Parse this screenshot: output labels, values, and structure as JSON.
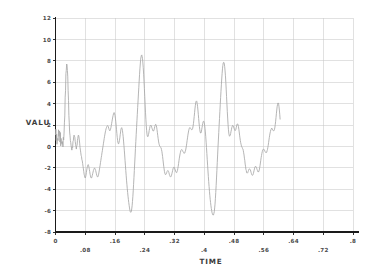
{
  "chart_data": {
    "type": "line",
    "title": "",
    "xlabel": "TIME",
    "ylabel": "VALU",
    "xlim": [
      0,
      0.8
    ],
    "ylim": [
      -8,
      12
    ],
    "grid": true,
    "legend": false,
    "line_color": "#a8a8a8",
    "axis_color": "#1a1a1a",
    "grid_color": "#c8c8c8",
    "x_ticks": [
      0,
      0.08,
      0.16,
      0.24,
      0.32,
      0.4,
      0.48,
      0.56,
      0.64,
      0.72,
      0.8
    ],
    "x_tick_labels": [
      "0",
      ".08",
      ".16",
      ".24",
      ".32",
      ".4",
      ".48",
      ".56",
      ".64",
      ".72",
      ".8"
    ],
    "y_ticks": [
      -8,
      -6,
      -4,
      -2,
      0,
      2,
      4,
      6,
      8,
      10,
      12
    ],
    "y_tick_labels": [
      "-8",
      "-6",
      "-4",
      "-2",
      "0",
      "2",
      "4",
      "6",
      "8",
      "10",
      "12"
    ],
    "x": [
      0.0,
      0.002,
      0.004,
      0.006,
      0.008,
      0.01,
      0.012,
      0.014,
      0.016,
      0.018,
      0.02,
      0.022,
      0.024,
      0.026,
      0.028,
      0.03,
      0.032,
      0.034,
      0.036,
      0.038,
      0.04,
      0.042,
      0.044,
      0.046,
      0.048,
      0.05,
      0.052,
      0.054,
      0.056,
      0.058,
      0.06,
      0.062,
      0.064,
      0.066,
      0.068,
      0.07,
      0.072,
      0.074,
      0.076,
      0.078,
      0.08,
      0.082,
      0.084,
      0.086,
      0.088,
      0.09,
      0.092,
      0.094,
      0.096,
      0.098,
      0.1,
      0.102,
      0.104,
      0.106,
      0.108,
      0.11,
      0.112,
      0.114,
      0.116,
      0.118,
      0.12,
      0.122,
      0.124,
      0.126,
      0.128,
      0.13,
      0.132,
      0.134,
      0.136,
      0.138,
      0.14,
      0.142,
      0.144,
      0.146,
      0.148,
      0.15,
      0.152,
      0.154,
      0.156,
      0.158,
      0.16,
      0.162,
      0.164,
      0.166,
      0.168,
      0.17,
      0.172,
      0.174,
      0.176,
      0.178,
      0.18,
      0.182,
      0.184,
      0.186,
      0.188,
      0.19,
      0.192,
      0.194,
      0.196,
      0.198,
      0.2,
      0.202,
      0.204,
      0.206,
      0.208,
      0.21,
      0.212,
      0.214,
      0.216,
      0.218,
      0.22,
      0.222,
      0.224,
      0.226,
      0.228,
      0.23,
      0.232,
      0.234,
      0.236,
      0.238,
      0.24,
      0.242,
      0.244,
      0.246,
      0.248,
      0.25,
      0.252,
      0.254,
      0.256,
      0.258,
      0.26,
      0.262,
      0.264,
      0.266,
      0.268,
      0.27,
      0.272,
      0.274,
      0.276,
      0.278,
      0.28,
      0.282,
      0.284,
      0.286,
      0.288,
      0.29,
      0.292,
      0.294,
      0.296,
      0.298,
      0.3,
      0.302,
      0.304,
      0.306,
      0.308,
      0.31,
      0.312,
      0.314,
      0.316,
      0.318,
      0.32,
      0.322,
      0.324,
      0.326,
      0.328,
      0.33,
      0.332,
      0.334,
      0.336,
      0.338,
      0.34,
      0.342,
      0.344,
      0.346,
      0.348,
      0.35,
      0.352,
      0.354,
      0.356,
      0.358,
      0.36,
      0.362,
      0.364,
      0.366,
      0.368,
      0.37,
      0.372,
      0.374,
      0.376,
      0.378,
      0.38,
      0.382,
      0.384,
      0.386,
      0.388,
      0.39,
      0.392,
      0.394,
      0.396,
      0.398,
      0.4,
      0.402,
      0.404,
      0.406,
      0.408,
      0.41,
      0.412,
      0.414,
      0.416,
      0.418,
      0.42,
      0.422,
      0.424,
      0.426,
      0.428,
      0.43,
      0.432,
      0.434,
      0.436,
      0.438,
      0.44,
      0.442,
      0.444,
      0.446,
      0.448,
      0.45,
      0.452,
      0.454,
      0.456,
      0.458,
      0.46,
      0.462,
      0.464,
      0.466,
      0.468,
      0.47,
      0.472,
      0.474,
      0.476,
      0.478,
      0.48,
      0.482,
      0.484,
      0.486,
      0.488,
      0.49,
      0.492,
      0.494,
      0.496,
      0.498,
      0.5,
      0.502,
      0.504,
      0.506,
      0.508,
      0.51,
      0.512,
      0.514,
      0.516,
      0.518,
      0.52,
      0.522,
      0.524,
      0.526,
      0.528,
      0.53,
      0.532,
      0.534,
      0.536,
      0.538,
      0.54,
      0.542,
      0.544,
      0.546,
      0.548,
      0.55,
      0.552,
      0.554,
      0.556,
      0.558,
      0.56,
      0.562,
      0.564,
      0.566,
      0.568,
      0.57,
      0.572,
      0.574,
      0.576,
      0.578,
      0.58,
      0.582,
      0.584,
      0.586,
      0.588,
      0.59,
      0.592,
      0.594,
      0.596,
      0.598,
      0.6,
      0.602,
      0.604
    ],
    "y": [
      1.1,
      0.55,
      0.2,
      0.75,
      1.55,
      1.2,
      0.4,
      0.05,
      0.3,
      0.2,
      -0.05,
      0.6,
      2.2,
      4.6,
      6.8,
      7.7,
      7.1,
      5.2,
      2.9,
      1.35,
      0.55,
      0.05,
      -0.35,
      -0.1,
      0.55,
      1.05,
      0.85,
      0.2,
      -0.25,
      0.1,
      0.75,
      1.05,
      0.6,
      -0.1,
      -0.6,
      -0.95,
      -1.35,
      -1.85,
      -2.35,
      -2.75,
      -2.95,
      -2.7,
      -2.2,
      -1.85,
      -1.7,
      -1.95,
      -2.35,
      -2.75,
      -2.95,
      -2.85,
      -2.55,
      -2.25,
      -2.05,
      -2.05,
      -2.25,
      -2.55,
      -2.8,
      -2.85,
      -2.6,
      -2.2,
      -1.75,
      -1.3,
      -0.85,
      -0.4,
      0.05,
      0.5,
      0.95,
      1.35,
      1.65,
      1.85,
      1.95,
      1.85,
      1.6,
      1.45,
      1.6,
      1.95,
      2.35,
      2.75,
      3.05,
      3.15,
      2.9,
      2.35,
      1.6,
      0.85,
      0.35,
      0.25,
      0.55,
      1.1,
      1.6,
      1.75,
      1.5,
      0.9,
      0.1,
      -0.8,
      -1.75,
      -2.7,
      -3.55,
      -4.3,
      -4.95,
      -5.5,
      -5.95,
      -6.15,
      -6.05,
      -5.55,
      -4.7,
      -3.55,
      -2.25,
      -0.9,
      0.45,
      1.75,
      3.0,
      4.25,
      5.5,
      6.7,
      7.7,
      8.35,
      8.55,
      8.2,
      7.35,
      6.1,
      4.65,
      3.2,
      1.95,
      1.15,
      0.9,
      1.1,
      1.5,
      1.85,
      2.0,
      1.9,
      1.65,
      1.45,
      1.45,
      1.7,
      2.0,
      2.05,
      1.8,
      1.3,
      0.75,
      0.3,
      0.05,
      -0.05,
      -0.15,
      -0.45,
      -0.95,
      -1.55,
      -2.1,
      -2.5,
      -2.65,
      -2.55,
      -2.35,
      -2.25,
      -2.35,
      -2.6,
      -2.8,
      -2.85,
      -2.7,
      -2.4,
      -2.1,
      -1.95,
      -2.0,
      -2.2,
      -2.4,
      -2.45,
      -2.25,
      -1.85,
      -1.35,
      -0.9,
      -0.55,
      -0.35,
      -0.3,
      -0.4,
      -0.55,
      -0.65,
      -0.6,
      -0.35,
      0.05,
      0.55,
      1.05,
      1.45,
      1.7,
      1.75,
      1.65,
      1.55,
      1.6,
      1.9,
      2.45,
      3.15,
      3.8,
      4.2,
      4.2,
      3.75,
      3.0,
      2.2,
      1.55,
      1.25,
      1.35,
      1.75,
      2.15,
      2.35,
      2.2,
      1.7,
      0.9,
      -0.1,
      -1.2,
      -2.3,
      -3.3,
      -4.2,
      -4.95,
      -5.55,
      -6.0,
      -6.3,
      -6.4,
      -6.25,
      -5.75,
      -4.85,
      -3.65,
      -2.25,
      -0.8,
      0.6,
      1.95,
      3.25,
      4.55,
      5.75,
      6.8,
      7.55,
      7.85,
      7.7,
      7.05,
      6.0,
      4.65,
      3.25,
      2.05,
      1.25,
      0.95,
      1.05,
      1.4,
      1.75,
      1.95,
      1.9,
      1.7,
      1.5,
      1.5,
      1.75,
      2.05,
      2.1,
      1.85,
      1.35,
      0.8,
      0.35,
      0.05,
      -0.1,
      -0.25,
      -0.6,
      -1.1,
      -1.65,
      -2.15,
      -2.45,
      -2.5,
      -2.35,
      -2.15,
      -2.1,
      -2.2,
      -2.45,
      -2.65,
      -2.7,
      -2.55,
      -2.25,
      -1.95,
      -1.85,
      -1.95,
      -2.15,
      -2.35,
      -2.4,
      -2.2,
      -1.8,
      -1.3,
      -0.85,
      -0.5,
      -0.3,
      -0.25,
      -0.35,
      -0.5,
      -0.6,
      -0.55,
      -0.3,
      0.1,
      0.6,
      1.05,
      1.4,
      1.6,
      1.65,
      1.55,
      1.45,
      1.5,
      1.8,
      2.35,
      3.05,
      3.7,
      4.05,
      3.95,
      3.4,
      2.55
    ],
    "y2": [
      1.6,
      1.15,
      0.7,
      0.55,
      0.95,
      1.45,
      1.3,
      0.75,
      0.35,
      0.45,
      0.85,
      1.25,
      2.85,
      5.2,
      7.1,
      7.6,
      6.5,
      4.3,
      2.2,
      1.0,
      0.35,
      -0.15,
      -0.05,
      0.45,
      0.95,
      0.95,
      0.45,
      0.0,
      0.05,
      0.55,
      1.0,
      0.9,
      0.3,
      -0.35,
      -0.85,
      -1.25,
      -1.6,
      -2.1,
      -2.6,
      -2.9,
      -2.85,
      -2.45,
      -2.0,
      -1.75,
      -1.8,
      -2.15,
      -2.6,
      -2.9,
      -2.95,
      -2.7,
      -2.4,
      -2.15,
      -2.05,
      -2.15,
      -2.4,
      -2.7,
      -2.85,
      -2.75,
      -2.4,
      -1.95,
      -1.5,
      -1.05,
      -0.6,
      -0.15,
      0.3,
      0.75,
      1.15,
      1.5,
      1.75,
      1.9,
      1.9,
      1.7,
      1.5,
      1.5,
      1.75,
      2.15,
      2.55,
      2.9,
      3.15,
      3.05,
      2.65,
      2.0,
      1.2,
      0.55,
      0.25,
      0.4,
      0.8,
      1.35,
      1.7,
      1.65,
      1.2,
      0.5,
      -0.35,
      -1.3,
      -2.25,
      -3.15,
      -3.95,
      -4.65,
      -5.25,
      -5.75,
      -6.1,
      -6.15,
      -5.85,
      -5.15,
      -4.15,
      -2.9,
      -1.55,
      -0.2,
      1.1,
      2.4,
      3.65,
      4.9,
      6.1,
      7.25,
      8.15,
      8.5,
      8.4,
      7.8,
      6.75,
      5.4,
      3.95,
      2.55,
      1.5,
      0.95,
      0.95,
      1.25,
      1.65,
      1.95,
      1.95,
      1.75,
      1.55,
      1.45,
      1.55,
      1.85,
      2.05,
      1.95,
      1.55,
      1.0,
      0.5,
      0.15,
      0.0,
      -0.1,
      -0.3,
      -0.7,
      -1.25,
      -1.85,
      -2.35,
      -2.6,
      -2.6,
      -2.45,
      -2.3,
      -2.3,
      -2.45,
      -2.7,
      -2.85,
      -2.8,
      -2.55,
      -2.25,
      -2.0,
      -1.95,
      -2.1,
      -2.3,
      -2.45,
      -2.35,
      -2.05,
      -1.6,
      -1.1,
      -0.7,
      -0.4,
      -0.3,
      -0.35,
      -0.5,
      -0.6,
      -0.6,
      -0.45,
      -0.15,
      0.3,
      0.8,
      1.25,
      1.6,
      1.75,
      1.7,
      1.6,
      1.55,
      1.7,
      2.15,
      2.8,
      3.5,
      4.05,
      4.25,
      4.0,
      3.4,
      2.6,
      1.85,
      1.35,
      1.25,
      1.55,
      1.95,
      2.3,
      2.35,
      2.0,
      1.35,
      0.4,
      -0.65,
      -1.75,
      -2.8,
      -3.75,
      -4.6,
      -5.25,
      -5.8,
      -6.2,
      -6.4,
      -6.4,
      -6.1,
      -5.4,
      -4.3,
      -2.95,
      -1.5,
      -0.05,
      1.3,
      2.6,
      3.9,
      5.15,
      6.3,
      7.25,
      7.8,
      7.85,
      7.45,
      6.6,
      5.35,
      3.95,
      2.65,
      1.6,
      1.05,
      1.0,
      1.2,
      1.55,
      1.85,
      1.95,
      1.8,
      1.6,
      1.5,
      1.6,
      1.9,
      2.1,
      2.0,
      1.6,
      1.05,
      0.55,
      0.2,
      -0.05,
      -0.2,
      -0.4,
      -0.8,
      -1.3,
      -1.85,
      -2.25,
      -2.45,
      -2.45,
      -2.25,
      -2.1,
      -2.15,
      -2.3,
      -2.55,
      -2.7,
      -2.65,
      -2.4,
      -2.1,
      -1.9,
      -1.9,
      -2.05,
      -2.25,
      -2.35,
      -2.3,
      -2.0,
      -1.55,
      -1.05,
      -0.65,
      -0.35,
      -0.25,
      -0.3,
      -0.45,
      -0.55,
      -0.55,
      -0.4,
      -0.1,
      0.35,
      0.85,
      1.25,
      1.55,
      1.7,
      1.65,
      1.5,
      1.45,
      1.6,
      2.05,
      2.7,
      3.4,
      3.9,
      4.05,
      3.7,
      3.0,
      2.1
    ],
    "series": [
      {
        "name": "VALU",
        "description": "quasi-periodic oscillating waveform with four major peak clusters"
      }
    ],
    "notes": {
      "data_x_start": 0.0,
      "data_x_end": 0.604,
      "data_y_min": -6.4,
      "data_y_max": 8.55,
      "approx_period": 0.16,
      "peak_values": [
        7.7,
        8.55,
        7.8,
        7.85
      ],
      "trough_values": [
        -6.15,
        -6.5,
        -6.4,
        -6.3
      ]
    }
  }
}
